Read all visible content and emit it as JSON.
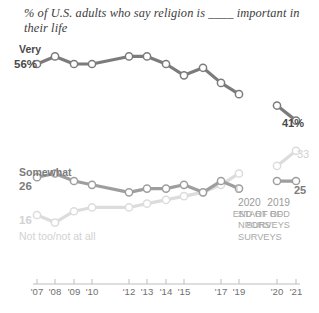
{
  "headline": "% of U.S. adults who say religion is ____ important in their life",
  "series_labels": {
    "very": "Very",
    "very_start_value": "56%",
    "very_end_value": "41%",
    "somewhat": "Somewhat",
    "somewhat_start_value": "26",
    "somewhat_end_value": "25",
    "nottoo": "Not too/not at all",
    "nottoo_start_value": "16",
    "nottoo_end_value": "33"
  },
  "annotations": {
    "left": {
      "year": "2019",
      "line1": "END OF RDD",
      "line2": "SURVEYS"
    },
    "right": {
      "year": "2020",
      "line1": "START OF",
      "line2": "NPORS",
      "line3": "SURVEYS"
    }
  },
  "colors": {
    "very": "#7b7b7b",
    "somewhat": "#9e9e9e",
    "nottoo": "#dcdcdc",
    "axis": "#bdbdbd",
    "text_dark": "#4a4a4a",
    "text_mid": "#7b7b7b",
    "text_light": "#d2d2d2",
    "marker_fill": "#ffffff"
  },
  "axis": {
    "tick_labels": [
      "'07",
      "'08",
      "'09",
      "'10",
      "'12",
      "'13",
      "'14",
      "'15",
      "'17",
      "'19",
      "'20",
      "'21"
    ]
  },
  "chart_data": {
    "type": "line",
    "title": "% of U.S. adults who say religion is ____ important in their life",
    "xlabel": "",
    "ylabel": "",
    "ylim": [
      0,
      70
    ],
    "grid": false,
    "legend": "inline-labels",
    "x": [
      "2007",
      "2008",
      "2009",
      "2010",
      "2012",
      "2013",
      "2014",
      "2015",
      "2017",
      "2019",
      "2020",
      "2021"
    ],
    "series": [
      {
        "name": "Very",
        "color": "#7b7b7b",
        "values": [
          56,
          58,
          56,
          56,
          58,
          58,
          56,
          53,
          55,
          51,
          48,
          45,
          41
        ],
        "x_values": [
          "2007",
          "2008",
          "2009",
          "2010",
          "2012",
          "2013",
          "2014",
          "2015",
          "2016",
          "2017",
          "2019",
          "2020",
          "2021"
        ],
        "start_label": "56%",
        "end_label": "41%"
      },
      {
        "name": "Somewhat",
        "color": "#9e9e9e",
        "values": [
          26,
          27,
          25,
          24,
          22,
          23,
          23,
          24,
          22,
          25,
          23,
          25,
          25
        ],
        "x_values": [
          "2007",
          "2008",
          "2009",
          "2010",
          "2012",
          "2013",
          "2014",
          "2015",
          "2016",
          "2017",
          "2019",
          "2020",
          "2021"
        ],
        "start_label": "26",
        "end_label": "25"
      },
      {
        "name": "Not too/not at all",
        "color": "#dcdcdc",
        "values": [
          16,
          14,
          17,
          18,
          18,
          19,
          20,
          21,
          22,
          24,
          27,
          29,
          33
        ],
        "x_values": [
          "2007",
          "2008",
          "2009",
          "2010",
          "2012",
          "2013",
          "2014",
          "2015",
          "2016",
          "2017",
          "2019",
          "2020",
          "2021"
        ],
        "start_label": "16",
        "end_label": "33"
      }
    ],
    "annotations": [
      {
        "text": "2019 END OF RDD SURVEYS",
        "x": "2019"
      },
      {
        "text": "2020 START OF NPORS SURVEYS",
        "x": "2020"
      }
    ]
  }
}
